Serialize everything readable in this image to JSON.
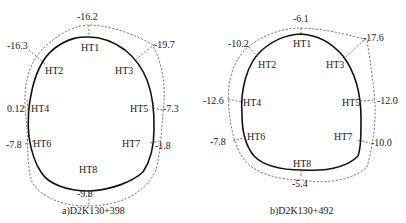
{
  "figures": [
    {
      "id": "a",
      "caption": "a)D2K130+398",
      "points": [
        {
          "name": "HT1",
          "value": "-16.2"
        },
        {
          "name": "HT2",
          "value": "-16.3"
        },
        {
          "name": "HT3",
          "value": "-19.7"
        },
        {
          "name": "HT4",
          "value": "0.12"
        },
        {
          "name": "HT5",
          "value": "-7.3"
        },
        {
          "name": "HT6",
          "value": "-7.8"
        },
        {
          "name": "HT7",
          "value": "-1.8"
        },
        {
          "name": "HT8",
          "value": "-9.8"
        }
      ]
    },
    {
      "id": "b",
      "caption": "b)D2K130+492",
      "points": [
        {
          "name": "HT1",
          "value": "-6.1"
        },
        {
          "name": "HT2",
          "value": "-10.2"
        },
        {
          "name": "HT3",
          "value": "-17.6"
        },
        {
          "name": "HT4",
          "value": "-12.6"
        },
        {
          "name": "HT5",
          "value": "-12.0"
        },
        {
          "name": "HT6",
          "value": "-7.8"
        },
        {
          "name": "HT7",
          "value": "-10.0"
        },
        {
          "name": "HT8",
          "value": "-5.4"
        }
      ]
    }
  ],
  "legend": {
    "solid_line": "design tunnel profile",
    "dashed_line": "deformation envelope"
  }
}
